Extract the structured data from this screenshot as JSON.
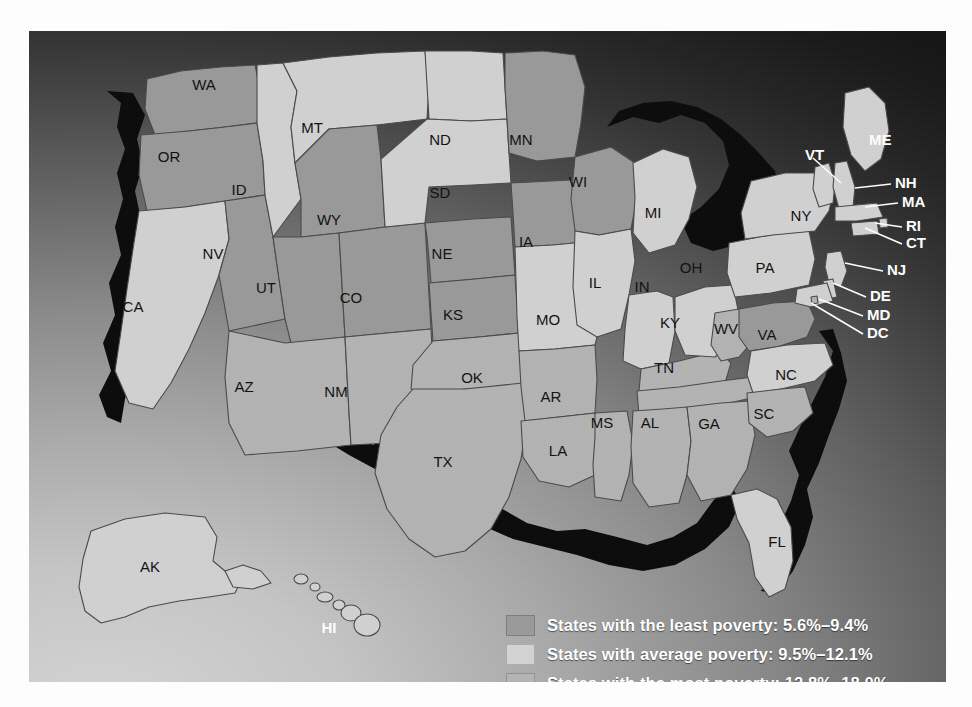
{
  "map": {
    "title": "United States poverty rate choropleth map",
    "background": {
      "light_corner": "#d6d6d6",
      "dark_corner": "#151515"
    },
    "shades": {
      "least": "#9a9a9a",
      "average": "#d2d2d2",
      "most": "#b4b4b4",
      "coast_shadow": "#0b0b0b",
      "border": "#4a4a4a"
    },
    "states": [
      {
        "code": "WA",
        "category": "least",
        "x": 175,
        "y": 55
      },
      {
        "code": "OR",
        "category": "least",
        "x": 140,
        "y": 127
      },
      {
        "code": "CA",
        "category": "average",
        "x": 104,
        "y": 277
      },
      {
        "code": "NV",
        "category": "least",
        "x": 184,
        "y": 224
      },
      {
        "code": "ID",
        "category": "average",
        "x": 210,
        "y": 160
      },
      {
        "code": "MT",
        "category": "average",
        "x": 283,
        "y": 98
      },
      {
        "code": "WY",
        "category": "least",
        "x": 300,
        "y": 190
      },
      {
        "code": "UT",
        "category": "least",
        "x": 237,
        "y": 258
      },
      {
        "code": "AZ",
        "category": "most",
        "x": 215,
        "y": 357
      },
      {
        "code": "CO",
        "category": "least",
        "x": 322,
        "y": 268
      },
      {
        "code": "NM",
        "category": "most",
        "x": 307,
        "y": 362
      },
      {
        "code": "ND",
        "category": "average",
        "x": 411,
        "y": 110
      },
      {
        "code": "SD",
        "category": "average",
        "x": 411,
        "y": 163
      },
      {
        "code": "NE",
        "category": "least",
        "x": 413,
        "y": 224
      },
      {
        "code": "KS",
        "category": "least",
        "x": 424,
        "y": 285
      },
      {
        "code": "OK",
        "category": "most",
        "x": 443,
        "y": 348
      },
      {
        "code": "TX",
        "category": "most",
        "x": 414,
        "y": 432
      },
      {
        "code": "MN",
        "category": "least",
        "x": 492,
        "y": 110
      },
      {
        "code": "IA",
        "category": "least",
        "x": 497,
        "y": 212
      },
      {
        "code": "MO",
        "category": "average",
        "x": 519,
        "y": 290
      },
      {
        "code": "AR",
        "category": "most",
        "x": 522,
        "y": 367
      },
      {
        "code": "LA",
        "category": "most",
        "x": 529,
        "y": 421
      },
      {
        "code": "WI",
        "category": "least",
        "x": 549,
        "y": 152
      },
      {
        "code": "IL",
        "category": "average",
        "x": 566,
        "y": 253
      },
      {
        "code": "MS",
        "category": "most",
        "x": 573,
        "y": 393
      },
      {
        "code": "MI",
        "category": "average",
        "x": 624,
        "y": 183
      },
      {
        "code": "IN",
        "category": "average",
        "x": 613,
        "y": 257
      },
      {
        "code": "KY",
        "category": "most",
        "x": 641,
        "y": 293
      },
      {
        "code": "TN",
        "category": "most",
        "x": 635,
        "y": 338
      },
      {
        "code": "AL",
        "category": "most",
        "x": 621,
        "y": 393
      },
      {
        "code": "OH",
        "category": "average",
        "x": 662,
        "y": 238
      },
      {
        "code": "GA",
        "category": "most",
        "x": 680,
        "y": 394
      },
      {
        "code": "WV",
        "category": "most",
        "x": 697,
        "y": 299
      },
      {
        "code": "VA",
        "category": "least",
        "x": 738,
        "y": 305
      },
      {
        "code": "NC",
        "category": "average",
        "x": 757,
        "y": 345
      },
      {
        "code": "SC",
        "category": "most",
        "x": 735,
        "y": 384
      },
      {
        "code": "FL",
        "category": "average",
        "x": 748,
        "y": 512
      },
      {
        "code": "PA",
        "category": "average",
        "x": 736,
        "y": 238
      },
      {
        "code": "NY",
        "category": "average",
        "x": 772,
        "y": 186
      },
      {
        "code": "AK",
        "category": "average",
        "x": 121,
        "y": 537
      },
      {
        "code": "HI",
        "category": "average",
        "x": 300,
        "y": 598,
        "label_color": "white"
      }
    ],
    "leader_labels": [
      {
        "code": "VT",
        "x": 776,
        "y": 125,
        "anchor": "end",
        "line": [
          [
            784,
            127
          ],
          [
            812,
            152
          ]
        ]
      },
      {
        "code": "ME",
        "x": 840,
        "y": 110,
        "anchor": "start",
        "line": []
      },
      {
        "code": "NH",
        "x": 866,
        "y": 153,
        "anchor": "start",
        "line": [
          [
            826,
            157
          ],
          [
            862,
            153
          ]
        ]
      },
      {
        "code": "MA",
        "x": 873,
        "y": 172,
        "anchor": "start",
        "line": [
          [
            836,
            176
          ],
          [
            869,
            172
          ]
        ]
      },
      {
        "code": "RI",
        "x": 877,
        "y": 196,
        "anchor": "start",
        "line": [
          [
            846,
            192
          ],
          [
            873,
            196
          ]
        ]
      },
      {
        "code": "CT",
        "x": 877,
        "y": 213,
        "anchor": "start",
        "line": [
          [
            836,
            197
          ],
          [
            873,
            213
          ]
        ]
      },
      {
        "code": "NJ",
        "x": 858,
        "y": 240,
        "anchor": "start",
        "line": [
          [
            816,
            232
          ],
          [
            854,
            240
          ]
        ]
      },
      {
        "code": "DE",
        "x": 841,
        "y": 266,
        "anchor": "start",
        "line": [
          [
            804,
            252
          ],
          [
            837,
            266
          ]
        ]
      },
      {
        "code": "MD",
        "x": 838,
        "y": 285,
        "anchor": "start",
        "line": [
          [
            790,
            268
          ],
          [
            834,
            285
          ]
        ]
      },
      {
        "code": "DC",
        "x": 838,
        "y": 303,
        "anchor": "start",
        "line": [
          [
            782,
            272
          ],
          [
            834,
            303
          ]
        ]
      }
    ]
  },
  "legend": {
    "items": [
      {
        "swatch": "#9a9a9a",
        "text": "States with the least poverty: 5.6%–9.4%"
      },
      {
        "swatch": "#d2d2d2",
        "text": "States with average poverty: 9.5%–12.1%"
      },
      {
        "swatch": "#b4b4b4",
        "text": "States with the most poverty: 12.8%–18.0%"
      }
    ]
  }
}
